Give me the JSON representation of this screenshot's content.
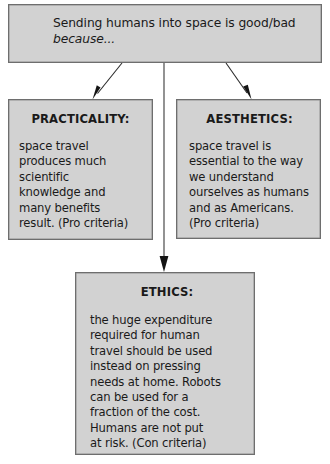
{
  "diagram": {
    "title_box": {
      "lines": [
        {
          "text": "Sending humans into space is good/bad",
          "style": "regular"
        },
        {
          "text": "because...",
          "style": "italic"
        }
      ]
    },
    "branches": [
      {
        "id": "practicality",
        "heading": "PRACTICALITY:",
        "body_lines": [
          "space travel",
          "produces much",
          "scientific",
          "knowledge and",
          "many benefits",
          "result. (Pro criteria)"
        ],
        "criteria": "(Pro criteria)"
      },
      {
        "id": "aesthetics",
        "heading": "AESTHETICS:",
        "body_lines": [
          "space travel is",
          "essential to the way",
          "we understand",
          "ourselves as humans",
          "and as Americans.",
          "(Pro criteria)"
        ],
        "criteria": "(Pro criteria)"
      },
      {
        "id": "ethics",
        "heading": "ETHICS:",
        "body_lines": [
          "the huge expenditure",
          "required for human",
          "travel should be used",
          "instead on pressing",
          "needs at home. Robots",
          "can be used for a",
          "fraction of the cost.",
          "Humans are not put",
          "at risk. (Con criteria)"
        ],
        "criteria": "(Con criteria)"
      }
    ],
    "connectors": [
      {
        "name": "arrow-to-practicality",
        "from": [
          122,
          63
        ],
        "to": [
          93,
          99
        ],
        "kind": "diagonal-arrow"
      },
      {
        "name": "arrow-to-ethics",
        "from": [
          164,
          63
        ],
        "to": [
          164,
          271
        ],
        "kind": "vertical-arrow"
      },
      {
        "name": "arrow-to-aesthetics",
        "from": [
          226,
          63
        ],
        "to": [
          251,
          99
        ],
        "kind": "diagonal-arrow"
      }
    ],
    "colors": {
      "box_fill": "#d2d2d2",
      "box_border": "#6e6e6e",
      "text": "#1a1a1a",
      "connector": "#2b2b2b",
      "background": "#ffffff"
    }
  }
}
